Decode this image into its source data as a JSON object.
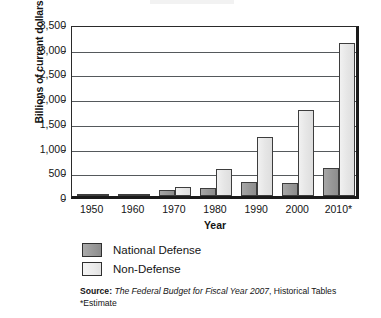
{
  "chart_data": {
    "type": "bar",
    "title": "",
    "xlabel": "Year",
    "ylabel": "Billions of current dollars",
    "ylim": [
      0,
      3500
    ],
    "ytick_labels": [
      "3,500",
      "3,000",
      "2,500",
      "2,000",
      "1,500",
      "1,000",
      "500",
      "0"
    ],
    "ytick_values": [
      3500,
      3000,
      2500,
      2000,
      1500,
      1000,
      500,
      0
    ],
    "grid": true,
    "legend_position": "below-axis-left",
    "categories": [
      "1950",
      "1960",
      "1970",
      "1980",
      "1990",
      "2000",
      "2010*"
    ],
    "series": [
      {
        "name": "National Defense",
        "color": "#9a9a9a",
        "values": [
          15,
          50,
          120,
          165,
          290,
          265,
          575
        ]
      },
      {
        "name": "Non-Defense",
        "color": "#e6e6e6",
        "values": [
          25,
          45,
          175,
          550,
          1200,
          1750,
          3100
        ]
      }
    ],
    "annotations": [
      "Source: The Federal Budget for Fiscal Year 2007, Historical Tables",
      "*Estimate"
    ]
  },
  "axes": {
    "y_title": "Billions of current dollars",
    "x_title": "Year"
  },
  "legend": {
    "items": [
      {
        "label": "National Defense",
        "swatch": "defense"
      },
      {
        "label": "Non-Defense",
        "swatch": "nondefense"
      }
    ]
  },
  "source": {
    "label": "Source:",
    "title": "The Federal Budget for Fiscal Year 2007",
    "tail": ", Historical Tables",
    "estimate_note": "*Estimate"
  }
}
